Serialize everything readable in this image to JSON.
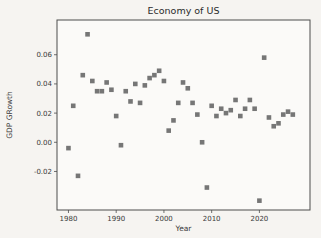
{
  "figure": {
    "background": "#f6f4f1",
    "plot_background": "#fbfaf8",
    "spine_color": "#4d4d4d",
    "text_color": "#3a3a3a"
  },
  "chart_data": {
    "type": "scatter",
    "title": "Economy of US",
    "xlabel": "Year",
    "ylabel": "GDP GRowth",
    "legend": "none",
    "grid": false,
    "marker": "square",
    "marker_color": "#6a6a6a",
    "marker_size_px": 4.6,
    "xlim": [
      1977.6,
      2030.6
    ],
    "ylim": [
      -0.0464,
      0.0838
    ],
    "x_ticks": [
      1980,
      1990,
      2000,
      2010,
      2020
    ],
    "y_ticks": [
      0.06,
      0.04,
      0.02,
      0.0,
      -0.02
    ],
    "years": [
      1980,
      1981,
      1982,
      1983,
      1984,
      1985,
      1986,
      1987,
      1988,
      1989,
      1990,
      1991,
      1992,
      1993,
      1994,
      1995,
      1996,
      1997,
      1998,
      1999,
      2000,
      2001,
      2002,
      2003,
      2004,
      2005,
      2006,
      2007,
      2008,
      2009,
      2010,
      2011,
      2012,
      2013,
      2014,
      2015,
      2016,
      2017,
      2018,
      2019,
      2020,
      2021,
      2022,
      2023,
      2024,
      2025,
      2026,
      2027
    ],
    "values": [
      -0.004,
      0.025,
      -0.023,
      0.046,
      0.074,
      0.042,
      0.035,
      0.035,
      0.041,
      0.036,
      0.018,
      -0.002,
      0.035,
      0.028,
      0.04,
      0.027,
      0.039,
      0.044,
      0.046,
      0.049,
      0.042,
      0.008,
      0.015,
      0.027,
      0.041,
      0.037,
      0.027,
      0.019,
      0.0,
      -0.031,
      0.025,
      0.018,
      0.023,
      0.02,
      0.022,
      0.029,
      0.018,
      0.023,
      0.029,
      0.023,
      -0.04,
      0.058,
      0.017,
      0.011,
      0.013,
      0.019,
      0.021,
      0.019
    ]
  }
}
